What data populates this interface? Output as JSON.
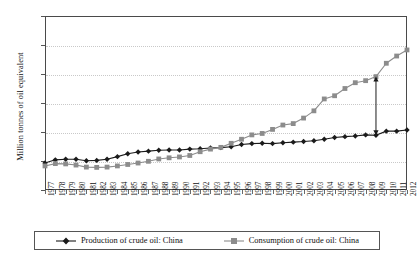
{
  "chart_data": {
    "type": "line",
    "title": "",
    "xlabel": "",
    "ylabel": "Million tonnes of oil equivalent",
    "ylim": [
      0,
      600
    ],
    "ytick_step": 100,
    "yticks": [
      "0",
      "100",
      "200",
      "300",
      "400",
      "500",
      "600"
    ],
    "grid": true,
    "grid_axis": "y",
    "legend_position": "bottom",
    "x": [
      "1977",
      "1978",
      "1979",
      "1980",
      "1981",
      "1982",
      "1983",
      "1984",
      "1985",
      "1986",
      "1987",
      "1988",
      "1989",
      "1990",
      "1991",
      "1992",
      "1993",
      "1994",
      "1995",
      "1996",
      "1997",
      "1998",
      "1999",
      "2000",
      "2001",
      "2002",
      "2003",
      "2004",
      "2005",
      "2006",
      "2007",
      "2008",
      "2009",
      "2010",
      "2011",
      "2012"
    ],
    "series": [
      {
        "name": "Production of crude oil: China",
        "color": "#1b1b1b",
        "marker": "diamond",
        "values": [
          93,
          104,
          106,
          106,
          101,
          102,
          106,
          115,
          125,
          131,
          134,
          137,
          138,
          138,
          141,
          142,
          145,
          146,
          149,
          157,
          160,
          161,
          160,
          163,
          165,
          167,
          170,
          175,
          181,
          184,
          186,
          190,
          189,
          203,
          203,
          207
        ]
      },
      {
        "name": "Consumption of crude oil: China",
        "color": "#8c8c8c",
        "marker": "square",
        "values": [
          83,
          91,
          90,
          86,
          79,
          78,
          79,
          83,
          88,
          93,
          99,
          107,
          111,
          114,
          119,
          132,
          141,
          147,
          161,
          175,
          190,
          195,
          209,
          224,
          229,
          248,
          273,
          314,
          325,
          350,
          370,
          377,
          391,
          437,
          462,
          483
        ]
      }
    ],
    "annotations": [
      {
        "name": "production-consumption-gap-arrow",
        "type": "double-headed-arrow",
        "x": "2009",
        "y_from": 189,
        "y_to": 391,
        "color": "#1b1b1b"
      }
    ]
  },
  "legend": {
    "items": [
      {
        "label": "Production of crude oil: China",
        "marker": "diamond-marker",
        "color": "#1b1b1b"
      },
      {
        "label": "Consumption of crude oil: China",
        "marker": "square-marker",
        "color": "#8c8c8c"
      }
    ]
  }
}
